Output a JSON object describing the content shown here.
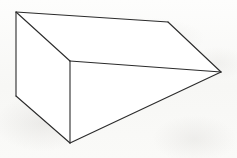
{
  "figure": {
    "title": "Wedge prism line drawing",
    "canvas": {
      "width": 237,
      "height": 158
    },
    "background_color": "#fbfbfa",
    "line_color": "#2b2b2b",
    "face_color": "#ffffff",
    "stroke_width": 1.1,
    "vertices": {
      "top_left_ridge": {
        "name": "top-left-ridge-vertex",
        "x": 16,
        "y": 12
      },
      "top_bend": {
        "name": "top-far-bend-vertex",
        "x": 168,
        "y": 22
      },
      "right_apex": {
        "name": "right-apex-vertex",
        "x": 221,
        "y": 72
      },
      "front_ridge": {
        "name": "front-ridge-vertex",
        "x": 70,
        "y": 61
      },
      "left_bottom": {
        "name": "left-bottom-vertex",
        "x": 16,
        "y": 96
      },
      "bottom_front": {
        "name": "bottom-front-vertex",
        "x": 70,
        "y": 143
      }
    },
    "faces": [
      {
        "name": "top-slanted-face",
        "points": "16,12 168,22 221,72 70,61"
      },
      {
        "name": "left-end-face",
        "points": "16,12 70,61 70,143 16,96"
      },
      {
        "name": "front-lower-face",
        "points": "70,61 221,72 70,143"
      }
    ],
    "edges": [
      {
        "name": "edge-top-back",
        "from": "top_left_ridge",
        "to": "top_bend",
        "points": "16,12 168,22"
      },
      {
        "name": "edge-top-right-slant",
        "from": "top_bend",
        "to": "right_apex",
        "points": "168,22 221,72"
      },
      {
        "name": "edge-ridge-to-apex",
        "from": "front_ridge",
        "to": "right_apex",
        "points": "70,61 221,72"
      },
      {
        "name": "edge-top-left-diagonal",
        "from": "top_left_ridge",
        "to": "front_ridge",
        "points": "16,12 70,61"
      },
      {
        "name": "edge-left-vertical",
        "from": "top_left_ridge",
        "to": "left_bottom",
        "points": "16,12 16,96"
      },
      {
        "name": "edge-left-bottom-diagonal",
        "from": "left_bottom",
        "to": "bottom_front",
        "points": "16,96 70,143"
      },
      {
        "name": "edge-front-vertical",
        "from": "front_ridge",
        "to": "bottom_front",
        "points": "70,61 70,143"
      },
      {
        "name": "edge-bottom-to-apex",
        "from": "bottom_front",
        "to": "right_apex",
        "points": "70,143 221,72"
      }
    ]
  }
}
